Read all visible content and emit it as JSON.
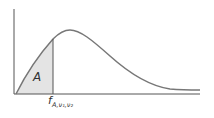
{
  "diagram": {
    "type": "F-distribution density curve with shaded left-tail area",
    "area_label": "A",
    "critical_value_label": {
      "main": "f",
      "subscript": "A,ν₁,ν₂"
    },
    "colors": {
      "axis": "#555555",
      "curve": "#777777",
      "shade": "#e4e4e4",
      "line": "#555555"
    }
  }
}
